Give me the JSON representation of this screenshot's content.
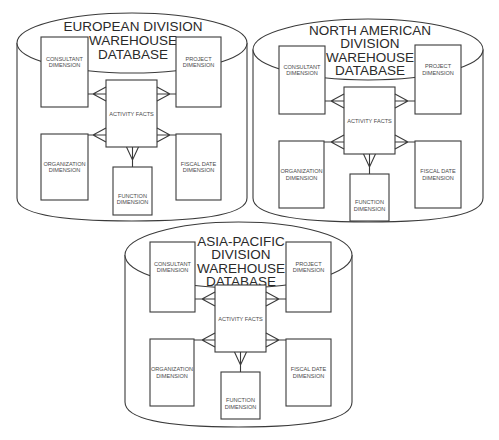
{
  "diagram": {
    "databases": [
      {
        "id": "european",
        "title_lines": [
          "EUROPEAN DIVISION",
          "WAREHOUSE",
          "DATABASE"
        ],
        "tables": {
          "consultant": [
            "CONSULTANT",
            "DIMENSION"
          ],
          "project": [
            "PROJECT",
            "DIMENSION"
          ],
          "facts": [
            "ACTIVITY FACTS"
          ],
          "organization": [
            "ORGANIZATION",
            "DIMENSION"
          ],
          "fiscal": [
            "FISCAL DATE",
            "DIMENSION"
          ],
          "function": [
            "FUNCTION",
            "DIMENSION"
          ]
        }
      },
      {
        "id": "north-american",
        "title_lines": [
          "NORTH AMERICAN",
          "DIVISION",
          "WAREHOUSE",
          "DATABASE"
        ],
        "tables": {
          "consultant": [
            "CONSULTANT",
            "DIMENSION"
          ],
          "project": [
            "PROJECT",
            "DIMENSION"
          ],
          "facts": [
            "ACTIVITY FACTS"
          ],
          "organization": [
            "ORGANIZATION",
            "DIMENSION"
          ],
          "fiscal": [
            "FISCAL DATE",
            "DIMENSION"
          ],
          "function": [
            "FUNCTION",
            "DIMENSION"
          ]
        }
      },
      {
        "id": "asia-pacific",
        "title_lines": [
          "ASIA-PACIFIC",
          "DIVISION",
          "WAREHOUSE",
          "DATABASE"
        ],
        "tables": {
          "consultant": [
            "CONSULTANT",
            "DIMENSION"
          ],
          "project": [
            "PROJECT",
            "DIMENSION"
          ],
          "facts": [
            "ACTIVITY FACTS"
          ],
          "organization": [
            "ORGANIZATION",
            "DIMENSION"
          ],
          "fiscal": [
            "FISCAL DATE",
            "DIMENSION"
          ],
          "function": [
            "FUNCTION",
            "DIMENSION"
          ]
        }
      }
    ],
    "relationship_type": "one-to-many (crow's foot at facts table)"
  }
}
